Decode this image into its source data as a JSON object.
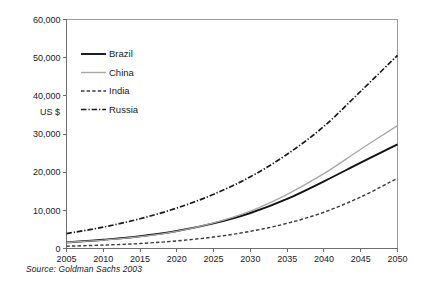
{
  "chart_data": {
    "type": "line",
    "title": "",
    "subtitle": "",
    "xlabel": "",
    "ylabel": "US $",
    "xlim": [
      2005,
      2050
    ],
    "ylim": [
      0,
      60000
    ],
    "grid": false,
    "legend_position": "top-left-inside",
    "x_tick_labels": [
      "2005",
      "2010",
      "2015",
      "2020",
      "2025",
      "2030",
      "2035",
      "2040",
      "2045",
      "2050"
    ],
    "x": [
      2005,
      2010,
      2015,
      2020,
      2025,
      2030,
      2035,
      2040,
      2045,
      2050
    ],
    "y_tick_labels": [
      "0",
      "10,000",
      "20,000",
      "30,000",
      "40,000",
      "50,000",
      "60,000"
    ],
    "y_ticks": [
      0,
      10000,
      20000,
      30000,
      40000,
      50000,
      60000
    ],
    "series": [
      {
        "name": "Brazil",
        "color": "#111111",
        "dash": "none",
        "width": 1.9,
        "values": [
          1600,
          2300,
          3200,
          4600,
          6600,
          9300,
          13000,
          17600,
          22500,
          27300
        ]
      },
      {
        "name": "China",
        "color": "#a8a8a8",
        "dash": "none",
        "width": 1.4,
        "values": [
          1600,
          2200,
          3100,
          4500,
          6700,
          9800,
          14200,
          19600,
          26000,
          32200
        ]
      },
      {
        "name": "India",
        "color": "#3a3a3a",
        "dash": "dashed",
        "width": 1.4,
        "values": [
          600,
          900,
          1300,
          2000,
          3000,
          4500,
          6600,
          9500,
          13500,
          18400
        ]
      },
      {
        "name": "Russia",
        "color": "#1a1a1a",
        "dash": "dashdot",
        "width": 1.7,
        "values": [
          3900,
          5600,
          7800,
          10600,
          14200,
          18800,
          24700,
          32000,
          41200,
          50600
        ]
      }
    ],
    "source_note": "Source:  Goldman Sachs 2003"
  },
  "legend": {
    "items": [
      {
        "label": "Brazil"
      },
      {
        "label": "China"
      },
      {
        "label": "India"
      },
      {
        "label": "Russia"
      }
    ]
  }
}
